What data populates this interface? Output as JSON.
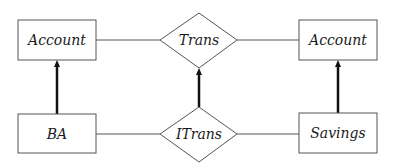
{
  "diagram": {
    "type": "er-diagram",
    "entities": [
      {
        "id": "account_left",
        "label": "Account"
      },
      {
        "id": "ba",
        "label": "BA"
      },
      {
        "id": "account_right",
        "label": "Account"
      },
      {
        "id": "savings",
        "label": "Savings"
      }
    ],
    "relationships": [
      {
        "id": "trans",
        "label": "Trans"
      },
      {
        "id": "itrans",
        "label": "ITrans"
      }
    ],
    "edges": [
      {
        "from": "account_left",
        "to": "trans",
        "style": "thin"
      },
      {
        "from": "trans",
        "to": "account_right",
        "style": "thin"
      },
      {
        "from": "ba",
        "to": "itrans",
        "style": "thin"
      },
      {
        "from": "itrans",
        "to": "savings",
        "style": "thin"
      },
      {
        "from": "ba",
        "to": "account_left",
        "style": "thick-arrow"
      },
      {
        "from": "itrans",
        "to": "trans",
        "style": "thick-arrow"
      },
      {
        "from": "savings",
        "to": "account_right",
        "style": "thick-arrow"
      }
    ],
    "colors": {
      "stroke": "#555555",
      "arrow": "#111111",
      "text": "#1a1a1a",
      "background": "#ffffff"
    }
  }
}
